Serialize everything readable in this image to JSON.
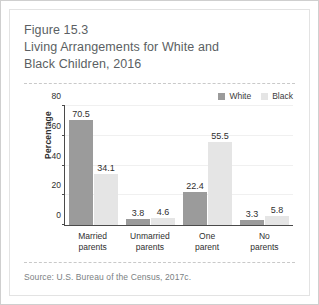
{
  "figure": {
    "title": "Figure 15.3\nLiving Arrangements for White and\nBlack Children, 2016",
    "source": "Source: U.S. Bureau of the Census, 2017c."
  },
  "colors": {
    "white_series": "#9b9b9b",
    "black_series": "#e5e5e5",
    "axis": "#4a4a4a",
    "title_text": "#5b5f63",
    "source_text": "#7b7f83",
    "card_border": "#cfcfcf"
  },
  "chart_data": {
    "type": "bar",
    "title": "Living Arrangements for White and Black Children, 2016",
    "xlabel": "",
    "ylabel": "Percentage",
    "ylim": [
      0,
      80
    ],
    "yticks": [
      0,
      20,
      40,
      60,
      80
    ],
    "grid": true,
    "legend_position": "top-right",
    "categories": [
      "Married\nparents",
      "Unmarried\nparents",
      "One\nparent",
      "No\nparents"
    ],
    "series": [
      {
        "name": "White",
        "values": [
          70.5,
          3.8,
          22.4,
          3.3
        ]
      },
      {
        "name": "Black",
        "values": [
          34.1,
          4.6,
          55.5,
          5.8
        ]
      }
    ]
  }
}
